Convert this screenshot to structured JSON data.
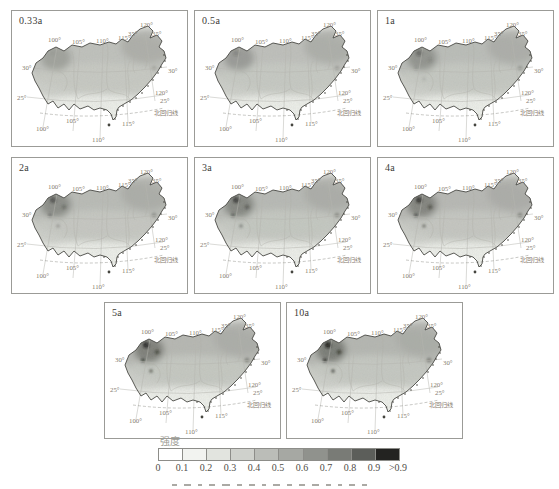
{
  "panels": [
    {
      "label": "0.33a",
      "shade_level": 0.18
    },
    {
      "label": "0.5a",
      "shade_level": 0.3
    },
    {
      "label": "1a",
      "shade_level": 0.45
    },
    {
      "label": "2a",
      "shade_level": 0.6
    },
    {
      "label": "3a",
      "shade_level": 0.72
    },
    {
      "label": "4a",
      "shade_level": 0.8
    },
    {
      "label": "5a",
      "shade_level": 0.9
    },
    {
      "label": "10a",
      "shade_level": 1.0
    }
  ],
  "map": {
    "lon_labels_top": [
      "100°",
      "105°",
      "110°",
      "115°"
    ],
    "lon_label_top_right": "120°",
    "lat_labels_top_right": [
      "35°",
      "35°"
    ],
    "lat_label_left_30": "30°",
    "lat_label_right_30": "30°",
    "lat_label_left_25": "25°",
    "lon_label_right_120": "120°",
    "lat_label_right_25": "25°",
    "tropic_of_cancer_label": "北回归线",
    "lon_labels_bottom": [
      "100°",
      "105°",
      "115°"
    ],
    "lon_label_bottom_center": "110°"
  },
  "legend": {
    "title": "强度",
    "tick_labels": [
      "0",
      "0.1",
      "0.2",
      "0.3",
      "0.4",
      "0.5",
      "0.6",
      "0.7",
      "0.8",
      "0.9",
      ">0.9"
    ],
    "segment_colors": [
      "#ffffff",
      "#f2f3f0",
      "#e2e4df",
      "#cfd1cc",
      "#bbbdb8",
      "#a6a8a3",
      "#90928d",
      "#797b76",
      "#5c5e5a",
      "#232321"
    ]
  },
  "colors": {
    "panel_border": "#9b9b97",
    "map_outline": "#4a4a45",
    "graticule": "#b5b5ae",
    "degree_label_text": "#857a6d",
    "panel_label_text": "#3c3c38"
  }
}
